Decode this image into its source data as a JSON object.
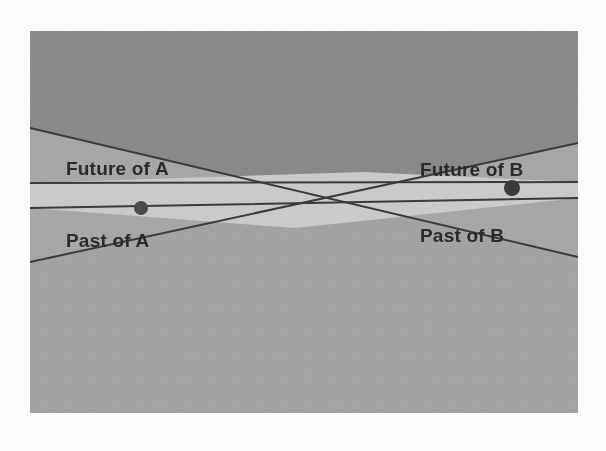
{
  "figure": {
    "kind": "spacetime-light-cone-diagram",
    "background_color": "#fcfcfa",
    "panel": {
      "x": 30,
      "y": 31,
      "width": 548,
      "height": 382,
      "outside_fill": "#8b8b8b",
      "single_cone_fill": "#a8a8a8",
      "below_fill": "#a4a4a4",
      "overlap_fill": "#cdcdcb",
      "line_color": "#3a3a3a",
      "line_width": 2
    },
    "events": [
      {
        "id": "A",
        "name": "event-a",
        "x": 141,
        "y": 208,
        "radius": 7,
        "color": "#4a4a4a"
      },
      {
        "id": "B",
        "name": "event-b",
        "x": 512,
        "y": 188,
        "radius": 8,
        "color": "#3c3c3c"
      }
    ],
    "labels": [
      {
        "id": "future-of-a",
        "text": "Future of A",
        "x": 66,
        "y": 175,
        "anchor": "start"
      },
      {
        "id": "past-of-a",
        "text": "Past of A",
        "x": 66,
        "y": 247,
        "anchor": "start"
      },
      {
        "id": "future-of-b",
        "text": "Future of B",
        "x": 420,
        "y": 176,
        "anchor": "start"
      },
      {
        "id": "past-of-b",
        "text": "Past of B",
        "x": 420,
        "y": 242,
        "anchor": "start"
      }
    ],
    "cone_lines": [
      {
        "id": "a-future-upper",
        "description": "upper boundary of the future light cone of A",
        "x1": 30,
        "y1": 128,
        "x2": 578,
        "y2": 257
      },
      {
        "id": "a-past-lower",
        "description": "lower boundary of the past light cone of A",
        "x1": 30,
        "y1": 262,
        "x2": 578,
        "y2": 143
      },
      {
        "id": "b-future-upper",
        "description": "upper boundary of the future light cone of B",
        "x1": 30,
        "y1": 183,
        "x2": 578,
        "y2": 182
      },
      {
        "id": "b-past-lower",
        "description": "lower boundary of the past light cone of B",
        "x1": 30,
        "y1": 208,
        "x2": 578,
        "y2": 198
      }
    ],
    "crossings": [
      {
        "id": "upper-crossing",
        "x": 363,
        "y": 172
      },
      {
        "id": "lower-crossing",
        "x": 295,
        "y": 228
      }
    ]
  }
}
